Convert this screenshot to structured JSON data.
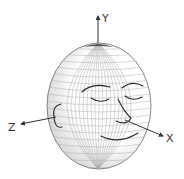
{
  "diagram": {
    "axes": {
      "x": {
        "label": "X"
      },
      "y": {
        "label": "Y"
      },
      "z": {
        "label": "Z"
      }
    },
    "head": {
      "shape": "ellipsoid wireframe",
      "features": [
        "eyebrows",
        "closed eyes",
        "nose",
        "smiling mouth",
        "ear"
      ]
    },
    "colors": {
      "mesh": "#9a9a9a",
      "outline": "#555555",
      "feature": "#2a2a2a",
      "axis": "#333333"
    }
  }
}
